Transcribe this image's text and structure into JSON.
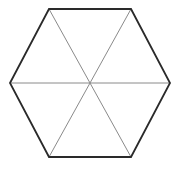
{
  "figure": {
    "name": "hexagon-subdivided-into-six-triangles",
    "shape_label": "hexagon",
    "background_color": "#ffffff",
    "canvas": {
      "width": 179,
      "height": 173
    },
    "outline": {
      "color": "#2a2a2a",
      "stroke_width": 1.8,
      "closed": true,
      "sides": 6,
      "vertex_count": 6,
      "vertices": [
        {
          "name": "left",
          "x": 10,
          "y": 83
        },
        {
          "name": "top-left",
          "x": 49,
          "y": 9
        },
        {
          "name": "top-right",
          "x": 131,
          "y": 9
        },
        {
          "name": "right",
          "x": 170,
          "y": 83
        },
        {
          "name": "bottom-right",
          "x": 131,
          "y": 157
        },
        {
          "name": "bottom-left",
          "x": 49,
          "y": 157
        }
      ],
      "points_attr": "10,83 49,9 131,9 170,83 131,157 49,157"
    },
    "center": {
      "name": "center",
      "x": 90,
      "y": 83
    },
    "diagonals": {
      "color": "#8a8a8a",
      "stroke_width": 1.0,
      "count": 3,
      "description": "three long diagonals joining opposite vertices through the center",
      "lines": [
        {
          "name": "diagonal-left-right",
          "x1": 10,
          "y1": 83,
          "x2": 170,
          "y2": 83
        },
        {
          "name": "diagonal-topleft-bottomright",
          "x1": 49,
          "y1": 9,
          "x2": 131,
          "y2": 157
        },
        {
          "name": "diagonal-topright-bottomleft",
          "x1": 131,
          "y1": 9,
          "x2": 49,
          "y2": 157
        }
      ]
    },
    "regions": {
      "count": 6,
      "description": "six triangular regions formed by the diagonals",
      "fill": "none"
    }
  }
}
